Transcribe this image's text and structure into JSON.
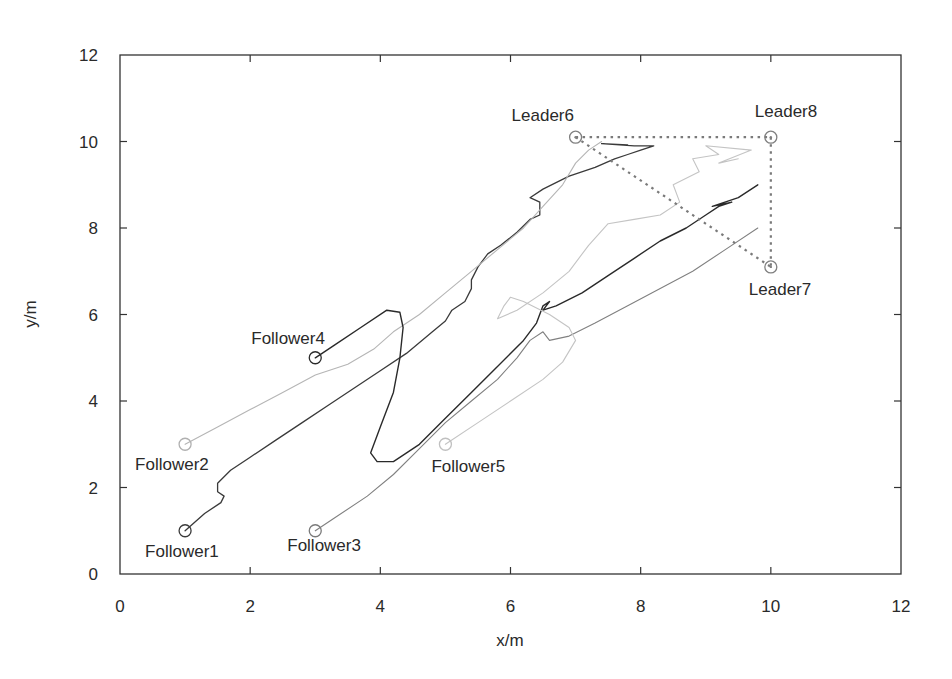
{
  "chart_data": {
    "type": "line",
    "title": "",
    "xlabel": "x/m",
    "ylabel": "y/m",
    "xlim": [
      0,
      12
    ],
    "ylim": [
      0,
      12
    ],
    "xticks": [
      0,
      2,
      4,
      6,
      8,
      10,
      12
    ],
    "yticks": [
      0,
      2,
      4,
      6,
      8,
      10,
      12
    ],
    "grid": false,
    "legend": "none (agents labeled inline)",
    "agents": [
      {
        "name": "Follower1",
        "role": "follower",
        "start": [
          1,
          1
        ],
        "color": "#3a3a3a",
        "label_offset": [
          -40,
          26
        ]
      },
      {
        "name": "Follower2",
        "role": "follower",
        "start": [
          1,
          3
        ],
        "color": "#b0b0b0",
        "label_offset": [
          -50,
          26
        ]
      },
      {
        "name": "Follower3",
        "role": "follower",
        "start": [
          3,
          1
        ],
        "color": "#7a7a7a",
        "label_offset": [
          -28,
          20
        ]
      },
      {
        "name": "Follower4",
        "role": "follower",
        "start": [
          3,
          5
        ],
        "color": "#2a2a2a",
        "label_offset": [
          -64,
          -14
        ]
      },
      {
        "name": "Follower5",
        "role": "follower",
        "start": [
          5,
          3
        ],
        "color": "#c0c0c0",
        "label_offset": [
          -14,
          28
        ]
      },
      {
        "name": "Leader6",
        "role": "leader",
        "position": [
          7,
          10.1
        ],
        "color": "#808080",
        "label_offset": [
          -64,
          -16
        ]
      },
      {
        "name": "Leader7",
        "role": "leader",
        "position": [
          10,
          7.1
        ],
        "color": "#808080",
        "label_offset": [
          -22,
          28
        ]
      },
      {
        "name": "Leader8",
        "role": "leader",
        "position": [
          10,
          10.1
        ],
        "color": "#808080",
        "label_offset": [
          -16,
          -20
        ]
      }
    ],
    "leader_formation": {
      "style": "dotted",
      "color": "#7a7a7a",
      "edges": [
        [
          "Leader6",
          "Leader8"
        ],
        [
          "Leader8",
          "Leader7"
        ],
        [
          "Leader6",
          "Leader7"
        ]
      ]
    },
    "series": [
      {
        "name": "Follower1",
        "color": "#3a3a3a",
        "width": 1.3,
        "points": [
          [
            1.0,
            1.0
          ],
          [
            1.3,
            1.4
          ],
          [
            1.55,
            1.65
          ],
          [
            1.6,
            1.8
          ],
          [
            1.5,
            1.9
          ],
          [
            1.5,
            2.1
          ],
          [
            1.7,
            2.4
          ],
          [
            2.0,
            2.7
          ],
          [
            2.4,
            3.1
          ],
          [
            2.8,
            3.5
          ],
          [
            3.2,
            3.9
          ],
          [
            3.6,
            4.3
          ],
          [
            4.0,
            4.7
          ],
          [
            4.4,
            5.1
          ],
          [
            4.8,
            5.6
          ],
          [
            5.0,
            5.85
          ],
          [
            5.1,
            6.1
          ],
          [
            5.3,
            6.3
          ],
          [
            5.4,
            6.6
          ],
          [
            5.4,
            6.8
          ],
          [
            5.5,
            7.1
          ],
          [
            5.65,
            7.4
          ],
          [
            5.85,
            7.6
          ],
          [
            6.1,
            7.9
          ],
          [
            6.3,
            8.2
          ],
          [
            6.45,
            8.3
          ],
          [
            6.45,
            8.6
          ],
          [
            6.3,
            8.7
          ],
          [
            6.5,
            8.9
          ],
          [
            6.9,
            9.2
          ],
          [
            7.3,
            9.4
          ],
          [
            7.6,
            9.6
          ],
          [
            7.8,
            9.7
          ],
          [
            8.0,
            9.8
          ],
          [
            8.2,
            9.9
          ],
          [
            7.9,
            9.9
          ],
          [
            7.4,
            9.95
          ],
          [
            7.8,
            9.92
          ]
        ]
      },
      {
        "name": "Follower2",
        "color": "#b5b5b5",
        "width": 1.1,
        "points": [
          [
            1.0,
            3.0
          ],
          [
            1.5,
            3.4
          ],
          [
            2.0,
            3.8
          ],
          [
            2.5,
            4.2
          ],
          [
            3.0,
            4.6
          ],
          [
            3.5,
            4.85
          ],
          [
            3.9,
            5.2
          ],
          [
            4.2,
            5.6
          ],
          [
            4.6,
            6.0
          ],
          [
            5.0,
            6.5
          ],
          [
            5.4,
            7.0
          ],
          [
            5.8,
            7.5
          ],
          [
            6.2,
            8.0
          ],
          [
            6.5,
            8.5
          ],
          [
            6.8,
            9.0
          ],
          [
            7.0,
            9.5
          ],
          [
            7.2,
            9.8
          ],
          [
            7.4,
            10.0
          ]
        ]
      },
      {
        "name": "Follower3",
        "color": "#808080",
        "width": 1.1,
        "points": [
          [
            3.0,
            1.0
          ],
          [
            3.3,
            1.3
          ],
          [
            3.8,
            1.8
          ],
          [
            4.2,
            2.3
          ],
          [
            4.6,
            2.9
          ],
          [
            5.0,
            3.5
          ],
          [
            5.4,
            4.0
          ],
          [
            5.8,
            4.5
          ],
          [
            6.1,
            5.0
          ],
          [
            6.3,
            5.4
          ],
          [
            6.5,
            5.6
          ],
          [
            6.6,
            5.4
          ],
          [
            6.9,
            5.5
          ],
          [
            7.3,
            5.8
          ],
          [
            7.8,
            6.2
          ],
          [
            8.3,
            6.6
          ],
          [
            8.8,
            7.0
          ],
          [
            9.3,
            7.5
          ],
          [
            9.8,
            8.0
          ]
        ]
      },
      {
        "name": "Follower4",
        "color": "#2a2a2a",
        "width": 1.4,
        "points": [
          [
            3.0,
            5.0
          ],
          [
            3.3,
            5.3
          ],
          [
            3.7,
            5.7
          ],
          [
            4.1,
            6.1
          ],
          [
            4.3,
            6.05
          ],
          [
            4.35,
            5.7
          ],
          [
            4.3,
            5.0
          ],
          [
            4.2,
            4.2
          ],
          [
            4.0,
            3.4
          ],
          [
            3.85,
            2.8
          ],
          [
            3.95,
            2.6
          ],
          [
            4.2,
            2.6
          ],
          [
            4.6,
            3.0
          ],
          [
            5.0,
            3.6
          ],
          [
            5.4,
            4.2
          ],
          [
            5.8,
            4.8
          ],
          [
            6.2,
            5.4
          ],
          [
            6.4,
            5.8
          ],
          [
            6.5,
            6.2
          ],
          [
            6.6,
            6.3
          ],
          [
            6.5,
            6.1
          ],
          [
            6.7,
            6.2
          ],
          [
            7.1,
            6.5
          ],
          [
            7.5,
            6.9
          ],
          [
            7.9,
            7.3
          ],
          [
            8.3,
            7.7
          ],
          [
            8.7,
            8.0
          ],
          [
            9.0,
            8.3
          ],
          [
            9.2,
            8.5
          ],
          [
            9.4,
            8.6
          ],
          [
            9.1,
            8.5
          ],
          [
            9.5,
            8.7
          ],
          [
            9.8,
            9.0
          ]
        ]
      },
      {
        "name": "Follower5",
        "color": "#c4c4c4",
        "width": 1.1,
        "points": [
          [
            5.0,
            3.0
          ],
          [
            5.5,
            3.5
          ],
          [
            6.0,
            4.0
          ],
          [
            6.5,
            4.5
          ],
          [
            6.8,
            4.9
          ],
          [
            7.0,
            5.4
          ],
          [
            6.9,
            5.7
          ],
          [
            6.6,
            6.0
          ],
          [
            6.2,
            6.3
          ],
          [
            6.0,
            6.4
          ],
          [
            5.9,
            6.2
          ],
          [
            5.8,
            5.9
          ],
          [
            6.1,
            6.1
          ],
          [
            6.5,
            6.5
          ],
          [
            6.9,
            7.0
          ],
          [
            7.2,
            7.6
          ],
          [
            7.5,
            8.1
          ],
          [
            7.9,
            8.2
          ],
          [
            8.3,
            8.3
          ],
          [
            8.6,
            8.6
          ],
          [
            8.5,
            9.0
          ],
          [
            8.9,
            9.3
          ],
          [
            8.8,
            9.6
          ],
          [
            9.2,
            9.7
          ],
          [
            9.0,
            9.9
          ],
          [
            9.7,
            9.8
          ],
          [
            9.2,
            9.5
          ],
          [
            9.5,
            9.6
          ]
        ]
      }
    ]
  }
}
